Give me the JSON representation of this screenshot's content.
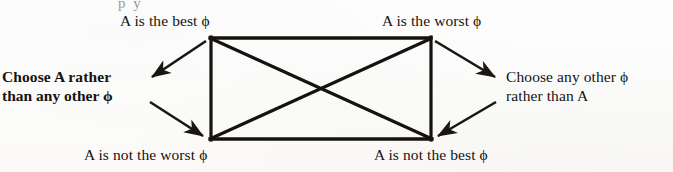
{
  "figure": {
    "kind": "square-of-opposition-diagram",
    "background_color": "#fdfdfc",
    "ink_color": "#17130f",
    "cropped_text_remnant": "p y"
  },
  "corners": {
    "top_left": "A is the best ϕ",
    "top_right": "A is the worst ϕ",
    "bottom_left": "A is not the worst ϕ",
    "bottom_right": "A is not the best ϕ"
  },
  "sides": {
    "left": {
      "line1": "Choose A rather",
      "line2": "than any other ϕ"
    },
    "right": {
      "line1": "Choose any other ϕ",
      "line2": "rather than A"
    }
  },
  "geometry": {
    "rect": {
      "x1": 210,
      "y1": 37,
      "x2": 431,
      "y2": 140
    },
    "diagonals": [
      {
        "from": "top_left",
        "to": "bottom_right"
      },
      {
        "from": "top_right",
        "to": "bottom_left"
      }
    ],
    "arrows": [
      {
        "name": "top-left-to-left-label",
        "x1": 206,
        "y1": 40,
        "x2": 150,
        "y2": 77
      },
      {
        "name": "left-label-to-bottom-left",
        "x1": 150,
        "y1": 103,
        "x2": 204,
        "y2": 137
      },
      {
        "name": "top-right-to-right-label",
        "x1": 435,
        "y1": 40,
        "x2": 497,
        "y2": 77
      },
      {
        "name": "right-label-to-bottom-right",
        "x1": 497,
        "y1": 103,
        "x2": 437,
        "y2": 137
      }
    ]
  }
}
